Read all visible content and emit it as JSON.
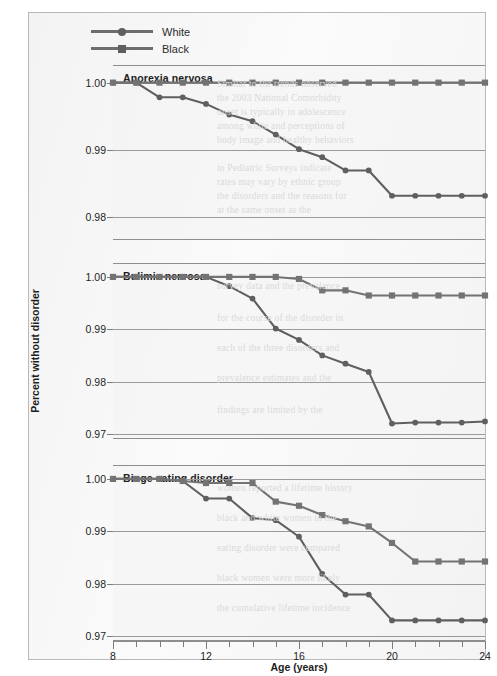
{
  "figure": {
    "legend": {
      "position": "top-left",
      "entries": [
        {
          "label": "White",
          "marker": "circle",
          "color": "#5f5f5f"
        },
        {
          "label": "Black",
          "marker": "square",
          "color": "#6f6f6f"
        }
      ]
    },
    "axis": {
      "xlabel": "Age (years)",
      "ylabel": "Percent without disorder",
      "x_tick_labels": [
        "8",
        "12",
        "16",
        "20",
        "24"
      ],
      "x_tick_values": [
        8,
        12,
        16,
        20,
        24
      ],
      "x_minor_ticks": [
        10,
        14,
        18,
        22
      ],
      "xlim": [
        8,
        24
      ]
    },
    "bleed_text": [
      "Similar to the trends observed",
      "the 2003 National Comorbidity",
      "onset is typically in adolescence",
      "among white and perceptions of",
      "body image and healthy behaviors",
      "in Pediatric Surveys indicate",
      "rates may vary by ethnic group",
      "the disorders and the reasons for",
      "at the same onset as the",
      "survey data and the prevalence",
      "for the course of the disorder in",
      "each of the three disorders and",
      "prevalence estimates and the",
      "findings are limited by the",
      "women reported a lifetime history",
      "black and white women in the",
      "eating disorder were compared",
      "black women were more likely",
      "the cumulative lifetime incidence"
    ]
  },
  "chart_data": [
    {
      "type": "line",
      "title": "Anorexia nervosa",
      "xlabel": "Age (years)",
      "ylabel": "Percent without disorder",
      "xlim": [
        8,
        24
      ],
      "ylim": [
        0.9765,
        1.0025
      ],
      "y_ticks": [
        1.0,
        0.99,
        0.98
      ],
      "y_tick_labels": [
        "1.00",
        "0.99",
        "0.98"
      ],
      "grid": true,
      "x": [
        8,
        9,
        10,
        11,
        12,
        13,
        14,
        15,
        16,
        17,
        18,
        19,
        20,
        21,
        22,
        23,
        24
      ],
      "series": [
        {
          "name": "White",
          "marker": "circle",
          "values": [
            1.0,
            1.0,
            0.9978,
            0.9978,
            0.9968,
            0.9952,
            0.9942,
            0.9922,
            0.99,
            0.9888,
            0.9868,
            0.9868,
            0.983,
            0.983,
            0.983,
            0.983,
            0.983
          ]
        },
        {
          "name": "Black",
          "marker": "square",
          "values": [
            1.0,
            1.0,
            1.0,
            1.0,
            1.0,
            1.0,
            1.0,
            1.0,
            1.0,
            1.0,
            1.0,
            1.0,
            1.0,
            1.0,
            1.0,
            1.0,
            1.0
          ]
        }
      ]
    },
    {
      "type": "line",
      "title": "Bulimia nervosa",
      "xlabel": "Age (years)",
      "ylabel": "Percent without disorder",
      "xlim": [
        8,
        24
      ],
      "ylim": [
        0.9688,
        1.0025
      ],
      "y_ticks": [
        1.0,
        0.99,
        0.98,
        0.97
      ],
      "y_tick_labels": [
        "1.00",
        "0.99",
        "0.98",
        "0.97"
      ],
      "grid": true,
      "x": [
        8,
        9,
        10,
        11,
        12,
        13,
        14,
        15,
        16,
        17,
        18,
        19,
        20,
        21,
        22,
        23,
        24
      ],
      "series": [
        {
          "name": "White",
          "marker": "circle",
          "values": [
            1.0,
            1.0,
            1.0,
            1.0,
            1.0,
            0.9982,
            0.9958,
            0.99,
            0.9878,
            0.9848,
            0.9832,
            0.9816,
            0.9716,
            0.9718,
            0.9718,
            0.9718,
            0.972
          ]
        },
        {
          "name": "Black",
          "marker": "square",
          "values": [
            1.0,
            1.0,
            1.0,
            1.0,
            1.0,
            1.0,
            1.0,
            1.0,
            0.9996,
            0.9974,
            0.9974,
            0.9964,
            0.9964,
            0.9964,
            0.9964,
            0.9964,
            0.9964
          ]
        }
      ]
    },
    {
      "type": "line",
      "title": "Binge eating disorder",
      "xlabel": "Age (years)",
      "ylabel": "Percent without disorder",
      "xlim": [
        8,
        24
      ],
      "ylim": [
        0.9688,
        1.0025
      ],
      "y_ticks": [
        1.0,
        0.99,
        0.98,
        0.97
      ],
      "y_tick_labels": [
        "1.00",
        "0.99",
        "0.98",
        "0.97"
      ],
      "grid": true,
      "x": [
        8,
        9,
        10,
        11,
        12,
        13,
        14,
        15,
        16,
        17,
        18,
        19,
        20,
        21,
        22,
        23,
        24
      ],
      "series": [
        {
          "name": "White",
          "marker": "circle",
          "values": [
            1.0,
            1.0,
            1.0,
            0.9996,
            0.9962,
            0.9962,
            0.9924,
            0.992,
            0.9888,
            0.9816,
            0.9776,
            0.9776,
            0.9726,
            0.9726,
            0.9726,
            0.9726,
            0.9726
          ]
        },
        {
          "name": "Black",
          "marker": "square",
          "values": [
            1.0,
            1.0,
            1.0,
            0.9996,
            0.9992,
            0.9992,
            0.9992,
            0.9956,
            0.9948,
            0.993,
            0.9918,
            0.9908,
            0.9876,
            0.984,
            0.984,
            0.984,
            0.984
          ]
        }
      ]
    }
  ]
}
